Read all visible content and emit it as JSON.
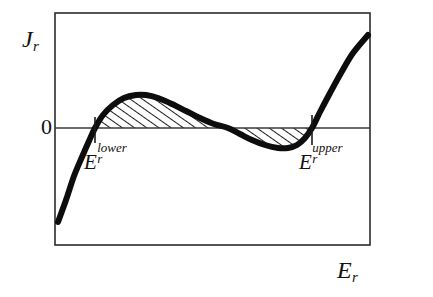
{
  "figure": {
    "background_color": "#ffffff",
    "frame": {
      "x": 55,
      "y": 13,
      "width": 315,
      "height": 232,
      "stroke_color": "#2b2b2b",
      "stroke_width": 1.6,
      "fill": "#ffffff"
    },
    "curve_color": "#0d0d0d",
    "curve_width": 6.0,
    "axis_line_color": "#3a3a3a",
    "axis_line_width": 1.3,
    "tick_color": "#1a1a1a",
    "tick_width": 1.6,
    "hatch_color": "#111111"
  },
  "labels": {
    "y_axis": {
      "base": "J",
      "sub": "r",
      "sup": ""
    },
    "zero": "0",
    "x_axis": {
      "base": "E",
      "sub": "r",
      "sup": ""
    },
    "lower_root": {
      "base": "E",
      "sub": "r",
      "sup": "lower"
    },
    "upper_root": {
      "base": "E",
      "sub": "r",
      "sup": "upper"
    }
  },
  "chart_data": {
    "type": "line",
    "title": "",
    "xlabel": "E_r",
    "ylabel": "J_r",
    "grid": false,
    "legend": null,
    "axis_note": "Unlabeled axes except a single y tick value 0; horizontal line drawn at J_r = 0 across full plot width.",
    "y_ticks": [
      {
        "label": "0",
        "pixel_y": 128
      }
    ],
    "x_ticks": [
      {
        "label": "E_r^lower",
        "pixel_x": 95
      },
      {
        "label": "E_r^upper",
        "pixel_x": 312
      }
    ],
    "zero_line": {
      "y_value": 0,
      "pixel_y": 128,
      "x_from": 55,
      "x_to": 370
    },
    "series": [
      {
        "name": "J_r(E_r)",
        "description": "Cubic-like S-shaped curve: rises from negative values, crosses zero at E_r^lower, peaks positive, crosses zero at the middle root, dips negative to a trough, then crosses zero at E_r^upper and rises steeply.",
        "points_pixel": [
          [
            58,
            222
          ],
          [
            66,
            200
          ],
          [
            74,
            176
          ],
          [
            82,
            157
          ],
          [
            89,
            141
          ],
          [
            95,
            128
          ],
          [
            103,
            115
          ],
          [
            113,
            105
          ],
          [
            124,
            98
          ],
          [
            136,
            95
          ],
          [
            146,
            95
          ],
          [
            158,
            98
          ],
          [
            172,
            104
          ],
          [
            186,
            111
          ],
          [
            200,
            118
          ],
          [
            214,
            124
          ],
          [
            228,
            128
          ],
          [
            240,
            134
          ],
          [
            252,
            140
          ],
          [
            265,
            145
          ],
          [
            278,
            148
          ],
          [
            288,
            148
          ],
          [
            297,
            145
          ],
          [
            305,
            138
          ],
          [
            312,
            128
          ],
          [
            320,
            112
          ],
          [
            330,
            93
          ],
          [
            341,
            73
          ],
          [
            353,
            53
          ],
          [
            368,
            35
          ]
        ],
        "roots_pixel_x": [
          95,
          228,
          312
        ],
        "peak_pixel": [
          143,
          95
        ],
        "trough_pixel": [
          285,
          148
        ]
      }
    ],
    "shaded_regions": [
      {
        "name": "upper-lobe-hatched-area",
        "fill": "diagonal-hatch",
        "between": "curve and J_r = 0",
        "x_from_pixel": 95,
        "x_to_pixel": 228,
        "sign": "positive"
      },
      {
        "name": "lower-lobe-hatched-area",
        "fill": "diagonal-hatch",
        "between": "curve and J_r = 0",
        "x_from_pixel": 228,
        "x_to_pixel": 312,
        "sign": "negative"
      }
    ]
  }
}
